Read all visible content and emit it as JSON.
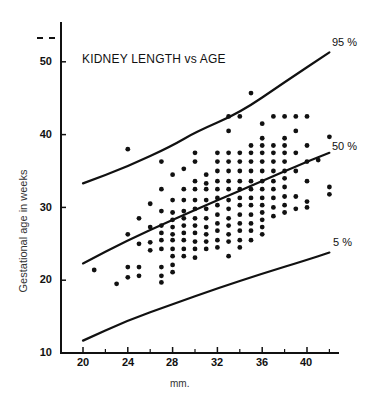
{
  "chart_data": {
    "type": "scatter",
    "title": "KIDNEY LENGTH vs AGE",
    "xlabel": "mm.",
    "ylabel": "Gestational age in weeks",
    "xlim": [
      18,
      43
    ],
    "ylim": [
      10,
      55
    ],
    "x_ticks": [
      20,
      24,
      28,
      32,
      36,
      40
    ],
    "x_minor_ticks": [
      22,
      26,
      30,
      34,
      38,
      42
    ],
    "y_ticks": [
      10,
      20,
      30,
      40,
      50
    ],
    "grid": false,
    "legend": null,
    "curves": [
      {
        "name": "95 %",
        "x": [
          20,
          24,
          28,
          30,
          34,
          38,
          42
        ],
        "y": [
          33.3,
          35.6,
          38.5,
          40.3,
          43.0,
          47.2,
          51.3
        ]
      },
      {
        "name": "50 %",
        "x": [
          20,
          24,
          28,
          32,
          36,
          40,
          42
        ],
        "y": [
          22.3,
          25.5,
          28.3,
          31.0,
          33.6,
          36.3,
          37.5
        ]
      },
      {
        "name": "5 %",
        "x": [
          20,
          24,
          28,
          32,
          36,
          40,
          42
        ],
        "y": [
          11.7,
          14.5,
          16.7,
          18.9,
          20.9,
          22.8,
          23.8
        ]
      }
    ],
    "points": [
      [
        21,
        21.4
      ],
      [
        23,
        19.5
      ],
      [
        24,
        38
      ],
      [
        24,
        26.3
      ],
      [
        24,
        21.8
      ],
      [
        24,
        20.4
      ],
      [
        25,
        28.5
      ],
      [
        25,
        25
      ],
      [
        25,
        21.8
      ],
      [
        25,
        20.6
      ],
      [
        26,
        30.5
      ],
      [
        26,
        27.3
      ],
      [
        26,
        25.2
      ],
      [
        26,
        24.1
      ],
      [
        27,
        36.3
      ],
      [
        27,
        32.5
      ],
      [
        27,
        29.5
      ],
      [
        27,
        27.5
      ],
      [
        27,
        26.5
      ],
      [
        27,
        25.5
      ],
      [
        27,
        24.3
      ],
      [
        27,
        21.8
      ],
      [
        27,
        20.6
      ],
      [
        27,
        19.7
      ],
      [
        28,
        34.5
      ],
      [
        28,
        31
      ],
      [
        28,
        29.3
      ],
      [
        28,
        28.3
      ],
      [
        28,
        27.3
      ],
      [
        28,
        26.3
      ],
      [
        28,
        25.5
      ],
      [
        28,
        24.3
      ],
      [
        28,
        23.3
      ],
      [
        28,
        22.1
      ],
      [
        28,
        21.1
      ],
      [
        29,
        35.3
      ],
      [
        29,
        32.5
      ],
      [
        29,
        31
      ],
      [
        29,
        29.5
      ],
      [
        29,
        28.5
      ],
      [
        29,
        27.5
      ],
      [
        29,
        26.5
      ],
      [
        29,
        25.5
      ],
      [
        29,
        24.3
      ],
      [
        29,
        23.3
      ],
      [
        30,
        37.5
      ],
      [
        30,
        36.3
      ],
      [
        30,
        33.6
      ],
      [
        30,
        32.5
      ],
      [
        30,
        31
      ],
      [
        30,
        29.8
      ],
      [
        30,
        28.5
      ],
      [
        30,
        27.5
      ],
      [
        30,
        26.5
      ],
      [
        30,
        25.3
      ],
      [
        30,
        24.3
      ],
      [
        30,
        23.1
      ],
      [
        31,
        34.5
      ],
      [
        31,
        33.3
      ],
      [
        31,
        32.5
      ],
      [
        31,
        31
      ],
      [
        31,
        29.8
      ],
      [
        31,
        28.5
      ],
      [
        31,
        27.3
      ],
      [
        31,
        26.3
      ],
      [
        31,
        25.3
      ],
      [
        31,
        24.3
      ],
      [
        32,
        37.5
      ],
      [
        32,
        36.3
      ],
      [
        32,
        35
      ],
      [
        32,
        33.6
      ],
      [
        32,
        32.5
      ],
      [
        32,
        31.3
      ],
      [
        32,
        30.3
      ],
      [
        32,
        29
      ],
      [
        32,
        27.8
      ],
      [
        32,
        26.8
      ],
      [
        32,
        25.5
      ],
      [
        32,
        24.5
      ],
      [
        33,
        42.5
      ],
      [
        33,
        40.5
      ],
      [
        33,
        37.5
      ],
      [
        33,
        36.3
      ],
      [
        33,
        35
      ],
      [
        33,
        33.6
      ],
      [
        33,
        32.5
      ],
      [
        33,
        31
      ],
      [
        33,
        29.8
      ],
      [
        33,
        28.5
      ],
      [
        33,
        27.5
      ],
      [
        33,
        26.3
      ],
      [
        33,
        25.3
      ],
      [
        33,
        23.3
      ],
      [
        34,
        42.5
      ],
      [
        34,
        37.5
      ],
      [
        34,
        36.3
      ],
      [
        34,
        35
      ],
      [
        34,
        33.6
      ],
      [
        34,
        32.5
      ],
      [
        34,
        31.3
      ],
      [
        34,
        30.3
      ],
      [
        34,
        29
      ],
      [
        34,
        27.8
      ],
      [
        34,
        26.8
      ],
      [
        34,
        25.5
      ],
      [
        34,
        24.5
      ],
      [
        35,
        45.7
      ],
      [
        35,
        38.5
      ],
      [
        35,
        37.5
      ],
      [
        35,
        36.3
      ],
      [
        35,
        35
      ],
      [
        35,
        33.6
      ],
      [
        35,
        32.5
      ],
      [
        35,
        31.3
      ],
      [
        35,
        30.3
      ],
      [
        35,
        29
      ],
      [
        35,
        27.8
      ],
      [
        35,
        26.8
      ],
      [
        35,
        25.5
      ],
      [
        36,
        41.5
      ],
      [
        36,
        39.5
      ],
      [
        36,
        38.5
      ],
      [
        36,
        37.5
      ],
      [
        36,
        36.3
      ],
      [
        36,
        35
      ],
      [
        36,
        33.6
      ],
      [
        36,
        32.5
      ],
      [
        36,
        31.3
      ],
      [
        36,
        30.3
      ],
      [
        36,
        29.3
      ],
      [
        36,
        28.3
      ],
      [
        36,
        27.3
      ],
      [
        36,
        26.3
      ],
      [
        37,
        42.5
      ],
      [
        37,
        38.5
      ],
      [
        37,
        37.5
      ],
      [
        37,
        36.3
      ],
      [
        37,
        35
      ],
      [
        37,
        33.6
      ],
      [
        37,
        32.5
      ],
      [
        37,
        31.3
      ],
      [
        37,
        30
      ],
      [
        37,
        28.8
      ],
      [
        38,
        42.5
      ],
      [
        38,
        39.5
      ],
      [
        38,
        38.5
      ],
      [
        38,
        37.5
      ],
      [
        38,
        36.3
      ],
      [
        38,
        35
      ],
      [
        38,
        34
      ],
      [
        38,
        32.8
      ],
      [
        38,
        31.5
      ],
      [
        38,
        30.3
      ],
      [
        38,
        29.3
      ],
      [
        39,
        42.5
      ],
      [
        39,
        40.5
      ],
      [
        39,
        37.5
      ],
      [
        39,
        35
      ],
      [
        39,
        31.5
      ],
      [
        39,
        29.8
      ],
      [
        40,
        42.5
      ],
      [
        40,
        38.5
      ],
      [
        40,
        36.3
      ],
      [
        40,
        33.6
      ],
      [
        40,
        30.8
      ],
      [
        40,
        30
      ],
      [
        41,
        36.5
      ],
      [
        42,
        39.7
      ],
      [
        42,
        32.8
      ],
      [
        42,
        31.8
      ]
    ]
  },
  "labels": {
    "title": "KIDNEY LENGTH vs AGE",
    "ylabel": "Gestational age in weeks",
    "xlabel": "mm.",
    "p95": "95 %",
    "p50": "50 %",
    "p5": "5 %",
    "y_ticks": [
      "10",
      "20",
      "30",
      "40",
      "50"
    ],
    "x_ticks": [
      "20",
      "24",
      "28",
      "32",
      "36",
      "40"
    ]
  }
}
